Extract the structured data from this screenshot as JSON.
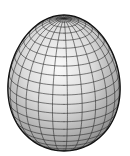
{
  "figure": {
    "background": "#ffffff",
    "surface_light": "#f4f4f4",
    "surface_dark": "#8a8a8a",
    "grid_color": "#2a2a2a",
    "outline_color": "#111111",
    "center": [
      64,
      83
    ],
    "radius_x": 56,
    "radius_y": 68,
    "longitude_lines": 24,
    "latitude_lines": 22
  }
}
